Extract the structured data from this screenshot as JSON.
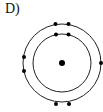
{
  "option_label": "D)",
  "diagram": {
    "type": "bohr-model",
    "nucleus": {
      "cx": 62,
      "cy": 63,
      "r": 3
    },
    "shells": [
      {
        "name": "inner",
        "r": 29,
        "electrons": 2
      },
      {
        "name": "outer",
        "r": 39,
        "electrons": 7
      }
    ],
    "colors": {
      "line": "#222222",
      "background": "#ffffff"
    }
  }
}
